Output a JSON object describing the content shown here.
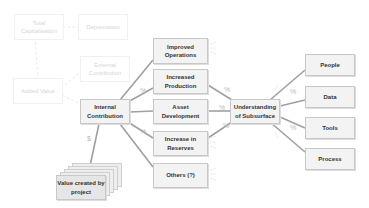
{
  "faded_nodes": {
    "total_capitalisation": "Total Capitalisation",
    "depreciation": "Depreciation",
    "external_contribution": "External Contribution",
    "added_value": "Added Value"
  },
  "nodes": {
    "internal_contribution": "Internal Contribution",
    "value_created": "Value created by project",
    "improved_operations": "Improved Operations",
    "increased_production": "Increased Production",
    "asset_development": "Asset Development",
    "increase_in_reserves": "Increase in Reserves",
    "others": "Others (?)",
    "understanding_subsurface": "Understanding of Subsurface",
    "people": "People",
    "data": "Data",
    "tools": "Tools",
    "process": "Process"
  },
  "edge_labels": {
    "dollar": "$",
    "percent": "%"
  },
  "colors": {
    "box_fill": "#f3f3f3",
    "box_border": "#c8c8c8",
    "connector": "#9a9a9a",
    "faded": "#d6d6d6"
  }
}
